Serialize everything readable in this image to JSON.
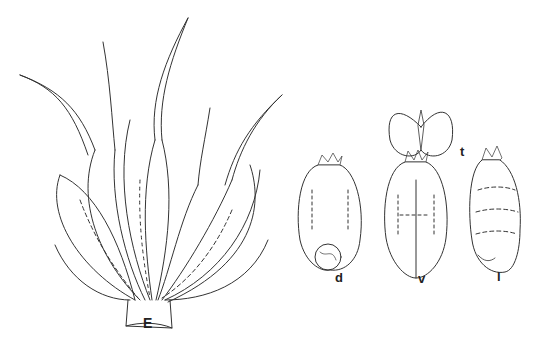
{
  "figure": {
    "type": "botanical line drawing",
    "labels": {
      "spikelet": "E",
      "caryopsis_dorsal": "d",
      "caryopsis_ventral": "v",
      "caryopsis_lateral": "l",
      "caryopsis_transverse": "t"
    },
    "colors": {
      "ink": "#222222",
      "background": "#ffffff"
    }
  }
}
